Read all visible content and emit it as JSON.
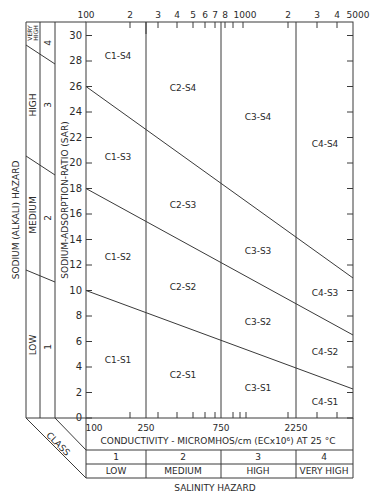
{
  "diagram": {
    "y_axis_label": "SODIUM-ADSORPTION-RATIO (SAR)",
    "y_ticks": [
      "0",
      "2",
      "4",
      "6",
      "8",
      "10",
      "12",
      "14",
      "16",
      "18",
      "20",
      "22",
      "24",
      "26",
      "28",
      "30"
    ],
    "top_axis_ticks": [
      {
        "label": "100",
        "x": 86
      },
      {
        "label": "2",
        "x": 130
      },
      {
        "label": "3",
        "x": 158
      },
      {
        "label": "4",
        "x": 177
      },
      {
        "label": "5",
        "x": 193
      },
      {
        "label": "6",
        "x": 205
      },
      {
        "label": "7",
        "x": 215
      },
      {
        "label": "8",
        "x": 225
      },
      {
        "label": "1000",
        "x": 243
      },
      {
        "label": "2",
        "x": 288
      },
      {
        "label": "3",
        "x": 317
      },
      {
        "label": "4",
        "x": 337
      },
      {
        "label": "5000",
        "x": 353
      }
    ],
    "bottom_axis_ticks": [
      "100",
      "250",
      "750",
      "2250"
    ],
    "x_axis_label": "CONDUCTIVITY - MICROMHOS/cm (ECx10⁶) AT 25 °C",
    "salinity_classes": [
      {
        "number": "1",
        "label": "LOW"
      },
      {
        "number": "2",
        "label": "MEDIUM"
      },
      {
        "number": "3",
        "label": "HIGH"
      },
      {
        "number": "4",
        "label": "VERY HIGH"
      }
    ],
    "salinity_hazard_label": "SALINITY HAZARD",
    "class_label": "CLASS",
    "sodium_hazard_label": "SODIUM (ALKALI) HAZARD",
    "sodium_classes": [
      {
        "number": "1",
        "label": "LOW"
      },
      {
        "number": "2",
        "label": "MEDIUM"
      },
      {
        "number": "3",
        "label": "HIGH"
      },
      {
        "number": "4",
        "label": "VERY HIGH"
      }
    ],
    "regions": {
      "c1s4": "C1-S4",
      "c2s4": "C2-S4",
      "c3s4": "C3-S4",
      "c4s4": "C4-S4",
      "c1s3": "C1-S3",
      "c2s3": "C2-S3",
      "c3s3": "C3-S3",
      "c4s3": "C4-S3",
      "c1s2": "C1-S2",
      "c2s2": "C2-S2",
      "c3s2": "C3-S2",
      "c4s2": "C4-S2",
      "c1s1": "C1-S1",
      "c2s1": "C2-S1",
      "c3s1": "C3-S1",
      "c4s1": "C4-S1"
    },
    "boundary_lines": [
      {
        "name": "S3-S4",
        "sar_at_100": 26,
        "sar_at_5000": 11
      },
      {
        "name": "S2-S3",
        "sar_at_100": 18,
        "sar_at_5000": 6.5
      },
      {
        "name": "S1-S2",
        "sar_at_100": 10,
        "sar_at_5000": 2.3
      }
    ],
    "conductivity_boundaries": [
      250,
      750,
      2250
    ]
  }
}
